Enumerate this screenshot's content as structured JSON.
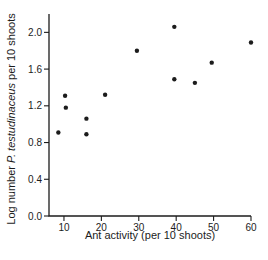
{
  "figure": {
    "background": "#ffffff",
    "ink_color": "#1c1c1c"
  },
  "chart_data": {
    "type": "scatter",
    "title": "",
    "xlabel": "Ant activity (per 10 shoots)",
    "ylabel_prefix": "Log number ",
    "ylabel_italic": "P. testudinaceus",
    "ylabel_suffix": " per 10 shoots",
    "xlim": [
      6,
      60
    ],
    "ylim": [
      0,
      2.2
    ],
    "x_ticks": [
      "10",
      "20",
      "30",
      "40",
      "50",
      "60"
    ],
    "y_ticks": [
      "0.0",
      "0.4",
      "0.8",
      "1.2",
      "1.6",
      "2.0"
    ],
    "grid": false,
    "legend": false,
    "marker": "filled-circle",
    "marker_color": "#1c1c1c",
    "points": [
      {
        "x": 8.5,
        "y": 0.91
      },
      {
        "x": 10.3,
        "y": 1.31
      },
      {
        "x": 10.5,
        "y": 1.18
      },
      {
        "x": 16.0,
        "y": 1.06
      },
      {
        "x": 16.0,
        "y": 0.89
      },
      {
        "x": 21.0,
        "y": 1.32
      },
      {
        "x": 29.5,
        "y": 1.8
      },
      {
        "x": 39.5,
        "y": 2.06
      },
      {
        "x": 39.5,
        "y": 1.49
      },
      {
        "x": 45.0,
        "y": 1.45
      },
      {
        "x": 49.5,
        "y": 1.67
      },
      {
        "x": 60.0,
        "y": 1.89
      }
    ]
  }
}
